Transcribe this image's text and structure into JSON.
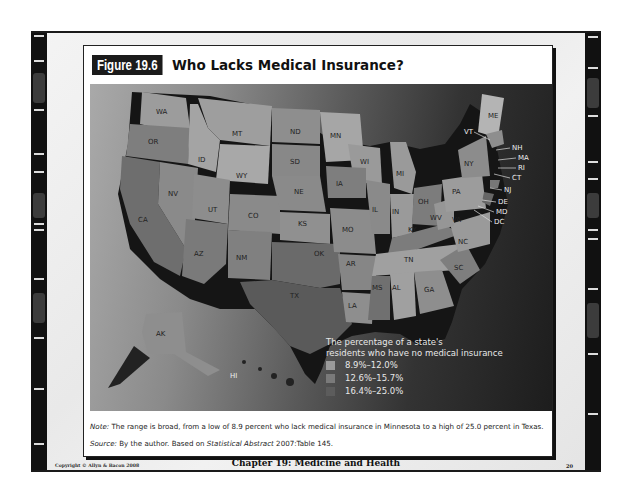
{
  "figure": {
    "badge": "Figure 19.6",
    "title": "Who Lacks Medical Insurance?"
  },
  "map": {
    "state_labels": [
      "WA",
      "OR",
      "CA",
      "NV",
      "ID",
      "MT",
      "WY",
      "UT",
      "AZ",
      "CO",
      "NM",
      "ND",
      "SD",
      "NE",
      "KS",
      "OK",
      "TX",
      "MN",
      "WI",
      "IA",
      "MO",
      "AR",
      "LA",
      "IL",
      "MI",
      "IN",
      "OH",
      "KY",
      "TN",
      "MS",
      "AL",
      "GA",
      "SC",
      "NC",
      "VA",
      "WV",
      "PA",
      "NY",
      "ME",
      "VT",
      "NH",
      "MA",
      "RI",
      "CT",
      "NJ",
      "DE",
      "MD",
      "DC",
      "AK",
      "HI"
    ],
    "legend": {
      "title_line1": "The percentage of a state's",
      "title_line2": "residents who have no medical insurance",
      "items": [
        {
          "label": "8.9%–12.0%",
          "color": "#9a9a9a"
        },
        {
          "label": "12.6%–15.7%",
          "color": "#7a7a7a"
        },
        {
          "label": "16.4%–25.0%",
          "color": "#5c5c5c"
        }
      ]
    }
  },
  "caption": {
    "note_label": "Note:",
    "note_text": " The range is broad, from a low of 8.9 percent who lack medical insurance in Minnesota to a high of 25.0 percent in Texas.",
    "source_label": "Source:",
    "source_text_pre": " By the author. Based on ",
    "source_italic": "Statistical Abstract",
    "source_text_post": " 2007:Table 145."
  },
  "footer": {
    "copyright": "Copyright © Allyn & Bacon 2008",
    "chapter": "Chapter 19: Medicine and Health",
    "page": "20"
  }
}
